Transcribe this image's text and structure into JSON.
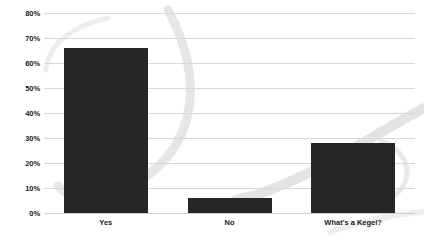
{
  "chart_data": {
    "type": "bar",
    "title": "",
    "subtitle": "",
    "xlabel": "",
    "ylabel": "",
    "categories": [
      "Yes",
      "No",
      "What's a Kegel?"
    ],
    "values": [
      66,
      6,
      28
    ],
    "ylim": [
      0,
      80
    ],
    "ytick_labels": [
      "0%",
      "10%",
      "20%",
      "30%",
      "40%",
      "50%",
      "60%",
      "70%",
      "80%"
    ],
    "ytick_values": [
      0,
      10,
      20,
      30,
      40,
      50,
      60,
      70,
      80
    ],
    "grid": true,
    "legend": "none",
    "series": [
      {
        "name": "Response share",
        "values": [
          66,
          6,
          28
        ]
      }
    ],
    "colors": {
      "bar": "#262626",
      "gridline": "#d9d9d9",
      "background": "#ffffff",
      "watermark": "#e8e8e8",
      "tick_text": "#1a1a1a"
    }
  }
}
